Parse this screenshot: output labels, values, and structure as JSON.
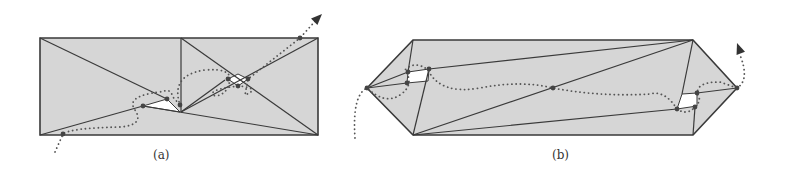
{
  "figure": {
    "colors": {
      "fill": "#d6d6d6",
      "edge": "#3a3a3a",
      "hole": "#ffffff",
      "path": "#555555",
      "point": "#444444"
    },
    "panels": [
      {
        "id": "a",
        "caption": "(a)",
        "outline": [
          [
            40,
            38
          ],
          [
            318,
            38
          ],
          [
            318,
            135
          ],
          [
            40,
            135
          ]
        ],
        "edges": [
          [
            [
              181,
              38
            ],
            [
              181,
              112
            ]
          ],
          [
            [
              40,
              38
            ],
            [
              167,
              99
            ]
          ],
          [
            [
              40,
              135
            ],
            [
              143,
              106
            ]
          ],
          [
            [
              143,
              106
            ],
            [
              318,
              135
            ]
          ],
          [
            [
              181,
              112
            ],
            [
              318,
              38
            ]
          ],
          [
            [
              181,
              38
            ],
            [
              318,
              135
            ]
          ],
          [
            [
              181,
              112
            ],
            [
              225,
              80
            ]
          ]
        ],
        "holes": [
          [
            [
              143,
              106
            ],
            [
              167,
              99
            ],
            [
              180,
              112
            ]
          ],
          [
            [
              228,
              79
            ],
            [
              238,
              74
            ],
            [
              248,
              79
            ],
            [
              238,
              86
            ]
          ]
        ],
        "points": [
          [
            63,
            134
          ],
          [
            143,
            106
          ],
          [
            167,
            99
          ],
          [
            180,
            105
          ],
          [
            228,
            79
          ],
          [
            248,
            79
          ],
          [
            238,
            86
          ],
          [
            300,
            38
          ]
        ],
        "path": "M 55 152 L 63 134 Q 70 128 120 127 Q 145 125 135 110 Q 125 96 160 92 Q 172 88 172 96 L 180 105 Q 170 75 205 70 Q 230 68 230 79 Q 228 95 215 96 Q 205 90 238 86 Q 262 88 245 95 L 248 79 L 300 38 L 318 18",
        "arrow": {
          "tip": [
            322,
            14
          ],
          "angle": -45
        }
      },
      {
        "id": "b",
        "caption": "(b)",
        "outline": [
          [
            367,
            88
          ],
          [
            413,
            40
          ],
          [
            693,
            40
          ],
          [
            737,
            88
          ],
          [
            693,
            135
          ],
          [
            413,
            135
          ]
        ],
        "edges": [
          [
            [
              413,
              40
            ],
            [
              408,
              72
            ]
          ],
          [
            [
              408,
              72
            ],
            [
              367,
              88
            ]
          ],
          [
            [
              367,
              88
            ],
            [
              407,
              83
            ]
          ],
          [
            [
              429,
              69
            ],
            [
              693,
              40
            ]
          ],
          [
            [
              413,
              135
            ],
            [
              693,
              40
            ]
          ],
          [
            [
              413,
              135
            ],
            [
              429,
              69
            ]
          ],
          [
            [
              413,
              135
            ],
            [
              677,
              109
            ]
          ],
          [
            [
              693,
              40
            ],
            [
              682,
              94
            ]
          ],
          [
            [
              697,
              93
            ],
            [
              737,
              88
            ]
          ],
          [
            [
              695,
              107
            ],
            [
              693,
              135
            ]
          ]
        ],
        "holes": [
          [
            [
              408,
              72
            ],
            [
              429,
              69
            ],
            [
              428,
              81
            ],
            [
              407,
              83
            ]
          ],
          [
            [
              682,
              94
            ],
            [
              697,
              93
            ],
            [
              697,
              106
            ],
            [
              677,
              109
            ]
          ]
        ],
        "points": [
          [
            367,
            88
          ],
          [
            408,
            72
          ],
          [
            429,
            69
          ],
          [
            407,
            83
          ],
          [
            553,
            88
          ],
          [
            697,
            93
          ],
          [
            695,
            107
          ],
          [
            677,
            109
          ],
          [
            737,
            88
          ]
        ],
        "path": "M 355 138 Q 352 95 367 88 Q 385 105 400 95 Q 415 85 405 70 Q 415 60 428 70 Q 440 95 480 88 Q 520 80 553 88 Q 600 97 650 94 Q 665 90 677 109 Q 690 118 700 100 Q 690 82 720 82 L 737 88 Q 750 80 740 55",
        "arrow": {
          "tip": [
            737,
            43
          ],
          "angle": -110
        }
      }
    ]
  }
}
